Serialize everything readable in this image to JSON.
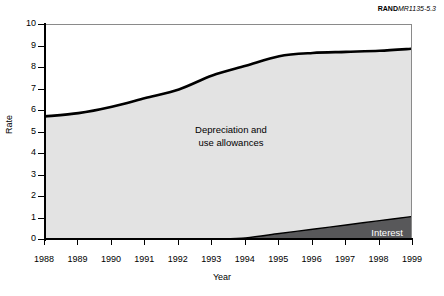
{
  "figure": {
    "source_brand": "RAND",
    "source_code": "MR1135-5.3"
  },
  "chart_data": {
    "type": "area",
    "title": "",
    "subtitle": "",
    "xlabel": "Year",
    "ylabel": "Rate",
    "x": [
      1988,
      1989,
      1990,
      1991,
      1992,
      1993,
      1994,
      1995,
      1996,
      1997,
      1998,
      1999
    ],
    "categories": [
      "1988",
      "1989",
      "1990",
      "1991",
      "1992",
      "1993",
      "1994",
      "1995",
      "1996",
      "1997",
      "1998",
      "1999"
    ],
    "xlim": [
      1988,
      1999
    ],
    "ylim": [
      0,
      10
    ],
    "ytick_labels": [
      "0",
      "1",
      "2",
      "3",
      "4",
      "5",
      "6",
      "7",
      "8",
      "9",
      "10"
    ],
    "yticks": [
      0,
      1,
      2,
      3,
      4,
      5,
      6,
      7,
      8,
      9,
      10
    ],
    "grid": false,
    "legend": "inline-labels",
    "stacked": true,
    "series": [
      {
        "name": "Interest",
        "label": "Interest",
        "color": "#58585a",
        "values": [
          0.0,
          0.0,
          0.0,
          0.0,
          0.0,
          0.05,
          0.1,
          0.3,
          0.5,
          0.7,
          0.9,
          1.1
        ]
      },
      {
        "name": "Depreciation and use allowances",
        "label": "Depreciation and\nuse allowances",
        "color": "#e3e3e3",
        "values": [
          5.75,
          5.9,
          6.2,
          6.6,
          7.0,
          7.6,
          8.0,
          8.25,
          8.5,
          8.65,
          8.7,
          8.8
        ]
      }
    ],
    "cumulative_top": [
      5.75,
      5.9,
      6.2,
      6.6,
      7.0,
      7.65,
      8.1,
      8.55,
      8.7,
      8.75,
      8.8,
      8.9
    ],
    "annotations": [
      {
        "name": "depreciation-area-label",
        "line1": "Depreciation and",
        "line2": "use allowances"
      },
      {
        "name": "interest-area-label",
        "text": "Interest"
      }
    ]
  },
  "axes": {
    "y_title": "Rate",
    "x_title": "Year"
  }
}
